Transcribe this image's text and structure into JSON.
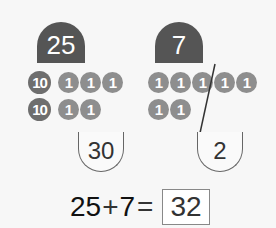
{
  "addends": {
    "left": {
      "label": "25",
      "tens_coins": 2,
      "ones_coins": 5,
      "coin_labels": {
        "ten": "10",
        "one": "1"
      },
      "result": "30"
    },
    "right": {
      "label": "7",
      "ones_coins": 7,
      "result": "2"
    }
  },
  "coins": {
    "left_row1": [
      "10",
      "1",
      "1",
      "1"
    ],
    "left_row2": [
      "10",
      "1",
      "1"
    ],
    "right_row1": [
      "1",
      "1",
      "1",
      "1",
      "1"
    ],
    "right_row2": [
      "1",
      "1"
    ]
  },
  "equation": {
    "a": "25",
    "op": "+",
    "b": "7",
    "eq": "=",
    "answer": "32"
  },
  "colors": {
    "tab": "#555555",
    "ten_coin": "#6e6e6e",
    "one_coin": "#8e8e8e",
    "background": "#f7f7f7"
  }
}
